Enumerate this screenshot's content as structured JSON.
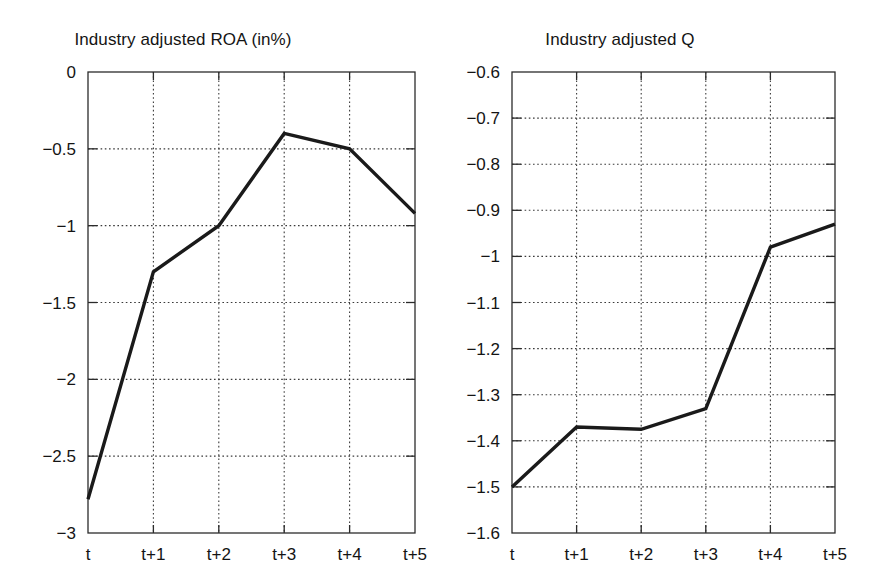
{
  "figure": {
    "background": "#ffffff",
    "line_color": "#1a1a1a",
    "axis_color": "#2b2b2b",
    "grid_color": "#3a3a3a"
  },
  "panels": [
    {
      "id": "roa",
      "title": "Industry adjusted ROA (in%)"
    },
    {
      "id": "q",
      "title": "Industry adjusted Q"
    }
  ],
  "chart_data": [
    {
      "type": "line",
      "title": "Industry adjusted ROA (in%)",
      "xlabel": "",
      "ylabel": "",
      "categories": [
        "t",
        "t+1",
        "t+2",
        "t+3",
        "t+4",
        "t+5"
      ],
      "x": [
        0,
        1,
        2,
        3,
        4,
        5
      ],
      "values": [
        -2.78,
        -1.3,
        -1.0,
        -0.4,
        -0.5,
        -0.92
      ],
      "series": [
        {
          "name": "Industry adjusted ROA",
          "values": [
            -2.78,
            -1.3,
            -1.0,
            -0.4,
            -0.5,
            -0.92
          ]
        }
      ],
      "ylim": [
        -3,
        0
      ],
      "xlim": [
        0,
        5
      ],
      "ytick_labels": [
        "0",
        "−0.5",
        "−1",
        "−1.5",
        "−2",
        "−2.5",
        "−3"
      ],
      "ytick_values": [
        0,
        -0.5,
        -1,
        -1.5,
        -2,
        -2.5,
        -3
      ],
      "xtick_labels": [
        "t",
        "t+1",
        "t+2",
        "t+3",
        "t+4",
        "t+5"
      ],
      "grid": true,
      "legend": "none"
    },
    {
      "type": "line",
      "title": "Industry adjusted Q",
      "xlabel": "",
      "ylabel": "",
      "categories": [
        "t",
        "t+1",
        "t+2",
        "t+3",
        "t+4",
        "t+5"
      ],
      "x": [
        0,
        1,
        2,
        3,
        4,
        5
      ],
      "values": [
        -1.5,
        -1.37,
        -1.375,
        -1.33,
        -0.98,
        -0.93
      ],
      "series": [
        {
          "name": "Industry adjusted Q",
          "values": [
            -1.5,
            -1.37,
            -1.375,
            -1.33,
            -0.98,
            -0.93
          ]
        }
      ],
      "ylim": [
        -1.6,
        -0.6
      ],
      "xlim": [
        0,
        5
      ],
      "ytick_labels": [
        "−0.6",
        "−0.7",
        "−0.8",
        "−0.9",
        "−1",
        "−1.1",
        "−1.2",
        "−1.3",
        "−1.4",
        "−1.5",
        "−1.6"
      ],
      "ytick_values": [
        -0.6,
        -0.7,
        -0.8,
        -0.9,
        -1.0,
        -1.1,
        -1.2,
        -1.3,
        -1.4,
        -1.5,
        -1.6
      ],
      "xtick_labels": [
        "t",
        "t+1",
        "t+2",
        "t+3",
        "t+4",
        "t+5"
      ],
      "grid": true,
      "legend": "none"
    }
  ]
}
